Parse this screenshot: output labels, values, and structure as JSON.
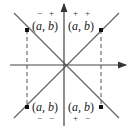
{
  "diagram": {
    "type": "coordinate-quadrants",
    "axes": {
      "x_arrow": true,
      "y_arrow": true,
      "color": "#444444"
    },
    "diagonals": {
      "color": "#666666",
      "lines": [
        "y=x",
        "y=-x"
      ]
    },
    "points": [
      {
        "quadrant": "II",
        "label": "(a, b)",
        "sign_a": "−",
        "sign_b": "+",
        "sign_position": "above"
      },
      {
        "quadrant": "I",
        "label": "(a, b)",
        "sign_a": "+",
        "sign_b": "+",
        "sign_position": "above"
      },
      {
        "quadrant": "III",
        "label": "(a, b)",
        "sign_a": "−",
        "sign_b": "−",
        "sign_position": "below"
      },
      {
        "quadrant": "IV",
        "label": "(a, b)",
        "sign_a": "+",
        "sign_b": "−",
        "sign_position": "below"
      }
    ]
  }
}
